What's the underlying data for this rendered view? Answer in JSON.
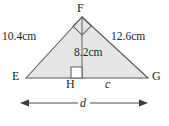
{
  "figure": {
    "type": "geometry-diagram",
    "shape": "triangle-with-altitude",
    "vertices": [
      {
        "name": "F",
        "label": "F",
        "role": "apex"
      },
      {
        "name": "E",
        "label": "E",
        "role": "base-left"
      },
      {
        "name": "G",
        "label": "G",
        "role": "base-right"
      },
      {
        "name": "H",
        "label": "H",
        "role": "altitude-foot"
      }
    ],
    "side_labels": [
      {
        "name": "EF",
        "label": "10.4cm",
        "value": 10.4,
        "unit": "cm"
      },
      {
        "name": "FG",
        "label": "12.6cm",
        "value": 12.6,
        "unit": "cm"
      },
      {
        "name": "FH",
        "label": "8.2cm",
        "value": 8.2,
        "unit": "cm"
      }
    ],
    "unknowns": [
      {
        "name": "c",
        "label": "c",
        "segment": "HG"
      },
      {
        "name": "d",
        "label": "d",
        "segment": "EG"
      }
    ],
    "right_angles": [
      {
        "name": "angle-F",
        "at": "F"
      },
      {
        "name": "angle-H",
        "at": "H"
      }
    ],
    "dimension_line": {
      "name": "d-dimension",
      "label": "d",
      "arrows": "both"
    },
    "colors": {
      "fill": "#e6e6e6",
      "stroke": "#5a5a5a",
      "text": "#262626",
      "dimension": "#4a4a4a"
    }
  }
}
